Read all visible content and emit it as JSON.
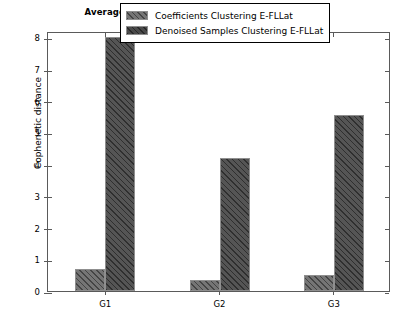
{
  "chart_data": {
    "type": "bar",
    "title": "Average cophenetic distance within each group",
    "xlabel": "",
    "ylabel": "Cophenetic distance",
    "categories": [
      "G1",
      "G2",
      "G3"
    ],
    "series": [
      {
        "name": "Coefficients Clustering E-FLLat",
        "values": [
          0.7,
          0.35,
          0.5
        ]
      },
      {
        "name": "Denoised Samples Clustering E-FLLat",
        "values": [
          8.0,
          4.2,
          5.55
        ]
      }
    ],
    "ylim": [
      0,
      8.2
    ],
    "yticks": [
      0,
      1,
      2,
      3,
      4,
      5,
      6,
      7,
      8
    ],
    "ytick_labels": [
      "0",
      "1",
      "2",
      "3",
      "4",
      "5",
      "6",
      "7",
      "8"
    ],
    "grid": false,
    "legend_position": "upper center"
  },
  "legend": {
    "entries": [
      "Coefficients Clustering E-FLLat",
      "Denoised Samples Clustering E-FLLat"
    ]
  }
}
